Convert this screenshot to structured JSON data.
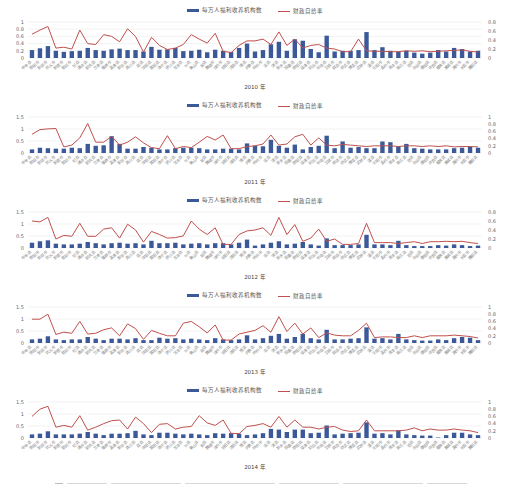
{
  "legend": {
    "bar_label": "每万人福利收养机构数",
    "line_label": "财政自给率"
  },
  "colors": {
    "bar": "#3b5998",
    "line": "#c0504d",
    "grid": "#e6e6e6"
  },
  "chart_data": [
    {
      "type": "bar+line",
      "title": "2010年",
      "xlabel": "",
      "ylabel_left": "每万人福利收养机构数",
      "ylabel_right": "财政自给率",
      "left_ylim": [
        0,
        1
      ],
      "left_ticks": [
        0,
        0.2,
        0.4,
        0.6,
        0.8,
        1
      ],
      "right_ylim": [
        0,
        0.8
      ],
      "right_ticks": [
        0,
        0.2,
        0.4,
        0.6,
        0.8
      ],
      "grid": true,
      "legend_position": "top",
      "series": [
        {
          "name": "每万人福利收养机构数",
          "axis": "left",
          "type": "bar",
          "values": [
            0.22,
            0.27,
            0.33,
            0.2,
            0.17,
            0.19,
            0.2,
            0.28,
            0.22,
            0.2,
            0.24,
            0.26,
            0.22,
            0.22,
            0.18,
            0.31,
            0.23,
            0.24,
            0.28,
            0.19,
            0.2,
            0.23,
            0.16,
            0.23,
            0.2,
            0.17,
            0.28,
            0.4,
            0.18,
            0.22,
            0.38,
            0.45,
            0.2,
            0.52,
            0.48,
            0.25,
            0.16,
            0.62,
            0.18,
            0.2,
            0.2,
            0.22,
            0.72,
            0.22,
            0.3,
            0.2,
            0.18,
            0.2,
            0.15,
            0.12,
            0.15,
            0.22,
            0.18,
            0.28,
            0.25,
            0.18,
            0.2
          ]
        },
        {
          "name": "财政自给率",
          "axis": "right",
          "type": "line",
          "values": [
            0.53,
            0.62,
            0.7,
            0.22,
            0.24,
            0.2,
            0.62,
            0.32,
            0.3,
            0.52,
            0.48,
            0.36,
            0.65,
            0.48,
            0.13,
            0.46,
            0.28,
            0.19,
            0.22,
            0.3,
            0.52,
            0.42,
            0.33,
            0.55,
            0.15,
            0.12,
            0.28,
            0.38,
            0.38,
            0.42,
            0.3,
            0.58,
            0.28,
            0.42,
            0.22,
            0.28,
            0.3,
            0.22,
            0.2,
            0.14,
            0.14,
            0.42,
            0.16,
            0.15,
            0.15,
            0.14,
            0.14,
            0.16,
            0.15,
            0.16,
            0.14,
            0.15,
            0.16,
            0.17,
            0.18,
            0.15,
            0.13
          ]
        }
      ]
    },
    {
      "type": "bar+line",
      "title": "2011年",
      "left_ylim": [
        0,
        1.5
      ],
      "left_ticks": [
        0,
        0.5,
        1,
        1.5
      ],
      "right_ylim": [
        0,
        1
      ],
      "right_ticks": [
        0,
        0.2,
        0.4,
        0.6,
        0.8,
        1
      ],
      "grid": true,
      "legend_position": "top",
      "series": [
        {
          "name": "每万人福利收养机构数",
          "axis": "left",
          "type": "bar",
          "values": [
            0.15,
            0.22,
            0.2,
            0.18,
            0.18,
            0.22,
            0.2,
            0.38,
            0.3,
            0.32,
            0.7,
            0.38,
            0.18,
            0.18,
            0.25,
            0.22,
            0.15,
            0.15,
            0.2,
            0.22,
            0.22,
            0.2,
            0.15,
            0.15,
            0.18,
            0.18,
            0.15,
            0.4,
            0.3,
            0.28,
            0.55,
            0.3,
            0.22,
            0.35,
            0.15,
            0.25,
            0.3,
            0.72,
            0.2,
            0.48,
            0.22,
            0.25,
            0.2,
            0.2,
            0.48,
            0.45,
            0.28,
            0.38,
            0.2,
            0.18,
            0.15,
            0.15,
            0.15,
            0.2,
            0.22,
            0.25,
            0.22
          ]
        },
        {
          "name": "财政自给率",
          "axis": "right",
          "type": "line",
          "values": [
            0.52,
            0.65,
            0.67,
            0.68,
            0.17,
            0.22,
            0.42,
            0.82,
            0.3,
            0.3,
            0.46,
            0.22,
            0.3,
            0.45,
            0.28,
            0.15,
            0.12,
            0.48,
            0.12,
            0.18,
            0.15,
            0.3,
            0.46,
            0.36,
            0.5,
            0.12,
            0.12,
            0.18,
            0.2,
            0.25,
            0.5,
            0.22,
            0.25,
            0.45,
            0.52,
            0.22,
            0.42,
            0.22,
            0.2,
            0.24,
            0.22,
            0.2,
            0.18,
            0.2,
            0.2,
            0.2,
            0.18,
            0.2,
            0.2,
            0.18,
            0.2,
            0.18,
            0.2,
            0.17,
            0.18,
            0.18,
            0.17
          ]
        }
      ]
    },
    {
      "type": "bar+line",
      "title": "2012年",
      "left_ylim": [
        0,
        1.5
      ],
      "left_ticks": [
        0,
        0.5,
        1,
        1.5
      ],
      "right_ylim": [
        0,
        0.8
      ],
      "right_ticks": [
        0,
        0.2,
        0.4,
        0.6,
        0.8
      ],
      "grid": true,
      "legend_position": "top",
      "series": [
        {
          "name": "每万人福利收养机构数",
          "axis": "left",
          "type": "bar",
          "values": [
            0.22,
            0.28,
            0.32,
            0.18,
            0.15,
            0.15,
            0.18,
            0.25,
            0.2,
            0.15,
            0.2,
            0.22,
            0.18,
            0.2,
            0.15,
            0.3,
            0.2,
            0.2,
            0.22,
            0.15,
            0.18,
            0.2,
            0.15,
            0.2,
            0.2,
            0.15,
            0.22,
            0.35,
            0.1,
            0.15,
            0.22,
            0.28,
            0.15,
            0.18,
            0.25,
            0.15,
            0.1,
            0.4,
            0.12,
            0.12,
            0.12,
            0.15,
            0.55,
            0.15,
            0.15,
            0.12,
            0.3,
            0.12,
            0.08,
            0.08,
            0.08,
            0.12,
            0.1,
            0.15,
            0.12,
            0.08,
            0.1
          ]
        },
        {
          "name": "财政自给率",
          "axis": "right",
          "type": "line",
          "values": [
            0.6,
            0.58,
            0.68,
            0.2,
            0.28,
            0.26,
            0.55,
            0.26,
            0.26,
            0.42,
            0.45,
            0.22,
            0.53,
            0.4,
            0.13,
            0.37,
            0.3,
            0.22,
            0.23,
            0.27,
            0.6,
            0.42,
            0.3,
            0.45,
            0.08,
            0.08,
            0.3,
            0.38,
            0.4,
            0.45,
            0.28,
            0.68,
            0.3,
            0.52,
            0.15,
            0.22,
            0.42,
            0.15,
            0.2,
            0.08,
            0.08,
            0.1,
            0.55,
            0.12,
            0.12,
            0.12,
            0.1,
            0.12,
            0.14,
            0.1,
            0.14,
            0.14,
            0.15,
            0.14,
            0.15,
            0.12,
            0.1
          ]
        }
      ]
    },
    {
      "type": "bar+line",
      "title": "2013年",
      "left_ylim": [
        0,
        1.5
      ],
      "left_ticks": [
        0,
        0.5,
        1,
        1.5
      ],
      "right_ylim": [
        0,
        1
      ],
      "right_ticks": [
        0,
        0.2,
        0.4,
        0.6,
        0.8,
        1
      ],
      "grid": true,
      "legend_position": "top",
      "series": [
        {
          "name": "每万人福利收养机构数",
          "axis": "left",
          "type": "bar",
          "values": [
            0.15,
            0.18,
            0.28,
            0.15,
            0.12,
            0.15,
            0.15,
            0.25,
            0.18,
            0.12,
            0.18,
            0.18,
            0.15,
            0.2,
            0.12,
            0.12,
            0.22,
            0.18,
            0.2,
            0.15,
            0.18,
            0.15,
            0.12,
            0.2,
            0.15,
            0.12,
            0.15,
            0.32,
            0.15,
            0.2,
            0.3,
            0.38,
            0.18,
            0.25,
            0.38,
            0.2,
            0.15,
            0.55,
            0.15,
            0.15,
            0.18,
            0.2,
            0.65,
            0.18,
            0.2,
            0.15,
            0.38,
            0.15,
            0.12,
            0.1,
            0.1,
            0.15,
            0.12,
            0.2,
            0.25,
            0.22,
            0.12
          ]
        },
        {
          "name": "财政自给率",
          "axis": "right",
          "type": "line",
          "values": [
            0.66,
            0.66,
            0.8,
            0.24,
            0.3,
            0.27,
            0.6,
            0.25,
            0.27,
            0.37,
            0.42,
            0.2,
            0.53,
            0.4,
            0.1,
            0.35,
            0.27,
            0.2,
            0.2,
            0.55,
            0.6,
            0.45,
            0.28,
            0.5,
            0.08,
            0.08,
            0.25,
            0.3,
            0.35,
            0.48,
            0.3,
            0.73,
            0.32,
            0.55,
            0.25,
            0.42,
            0.15,
            0.28,
            0.22,
            0.2,
            0.2,
            0.35,
            0.55,
            0.15,
            0.17,
            0.17,
            0.15,
            0.15,
            0.2,
            0.15,
            0.2,
            0.2,
            0.2,
            0.22,
            0.2,
            0.18,
            0.14
          ]
        }
      ]
    },
    {
      "type": "bar+line",
      "title": "2014年",
      "left_ylim": [
        0,
        1.5
      ],
      "left_ticks": [
        0,
        0.5,
        1,
        1.5
      ],
      "right_ylim": [
        0,
        1
      ],
      "right_ticks": [
        0,
        0.2,
        0.4,
        0.6,
        0.8,
        1
      ],
      "grid": true,
      "legend_position": "top",
      "series": [
        {
          "name": "每万人福利收养机构数",
          "axis": "left",
          "type": "bar",
          "values": [
            0.15,
            0.18,
            0.28,
            0.15,
            0.15,
            0.15,
            0.18,
            0.25,
            0.18,
            0.12,
            0.18,
            0.18,
            0.2,
            0.3,
            0.15,
            0.12,
            0.22,
            0.22,
            0.18,
            0.15,
            0.18,
            0.15,
            0.12,
            0.2,
            0.18,
            0.2,
            0.18,
            0.12,
            0.15,
            0.2,
            0.38,
            0.35,
            0.25,
            0.35,
            0.35,
            0.2,
            0.22,
            0.52,
            0.15,
            0.18,
            0.2,
            0.22,
            0.65,
            0.18,
            0.2,
            0.15,
            0.32,
            0.15,
            0.12,
            0.1,
            0.1,
            0.02,
            0.12,
            0.22,
            0.22,
            0.15,
            0.12
          ]
        },
        {
          "name": "财政自给率",
          "axis": "right",
          "type": "line",
          "values": [
            0.6,
            0.8,
            0.88,
            0.3,
            0.35,
            0.3,
            0.62,
            0.22,
            0.3,
            0.4,
            0.48,
            0.5,
            0.25,
            0.58,
            0.4,
            0.15,
            0.38,
            0.4,
            0.25,
            0.3,
            0.32,
            0.62,
            0.42,
            0.35,
            0.5,
            0.13,
            0.12,
            0.32,
            0.35,
            0.4,
            0.3,
            0.6,
            0.3,
            0.5,
            0.3,
            0.3,
            0.25,
            0.3,
            0.32,
            0.22,
            0.18,
            0.2,
            0.5,
            0.2,
            0.2,
            0.2,
            0.2,
            0.22,
            0.28,
            0.2,
            0.25,
            0.22,
            0.22,
            0.25,
            0.22,
            0.2,
            0.15
          ]
        }
      ]
    }
  ],
  "categories": [
    "中牟县",
    "荥阳市",
    "新郑市",
    "巩义市",
    "新密市",
    "登封市",
    "杞县",
    "通许县",
    "尉氏县",
    "兰考县",
    "偃师市",
    "孟津县",
    "新安县",
    "栾川县",
    "嵩县",
    "汝阳县",
    "宜阳县",
    "洛宁县",
    "伊川县",
    "宝丰县",
    "叶县",
    "鲁山县",
    "郏县",
    "舞钢市",
    "汝州市",
    "安阳县",
    "汤阴县",
    "滑县",
    "内黄县",
    "林州市",
    "浚县",
    "淇县",
    "新乡县",
    "获嘉县",
    "原阳县",
    "延津县",
    "封丘县",
    "长垣县",
    "卫辉市",
    "辉县市",
    "修武县",
    "博爱县",
    "武陟县",
    "温县",
    "沁阳市",
    "孟州市",
    "清丰县",
    "南乐县",
    "范县",
    "台前县",
    "濮阳县",
    "许昌县",
    "鄢陵县",
    "襄城县",
    "禹州市",
    "长葛市",
    "舞阳县"
  ],
  "panels": [
    {
      "year_label": "2010 年"
    },
    {
      "year_label": "2011 年"
    },
    {
      "year_label": "2012 年"
    },
    {
      "year_label": "2013 年"
    },
    {
      "year_label": "2014 年"
    }
  ]
}
